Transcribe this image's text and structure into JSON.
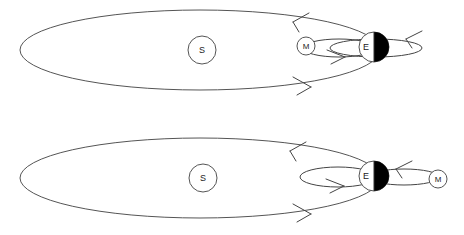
{
  "figure": {
    "background_color": "#ffffff",
    "width": 464,
    "height": 235,
    "stroke_color": "#555555",
    "shadow_color": "#000000"
  },
  "panels": [
    {
      "id": "top-panel",
      "name": "solar-eclipse-configuration",
      "bodies": {
        "sun": {
          "label": "S",
          "cx": 202,
          "cy": 50,
          "r": 14
        },
        "earth": {
          "label": "E",
          "cx": 374,
          "cy": 47,
          "r": 15,
          "shadow_side": "right"
        },
        "moon": {
          "label": "M",
          "cx": 306,
          "cy": 46,
          "r": 9,
          "side": "sunward"
        }
      },
      "orbits": {
        "earth_orbit": {
          "cx": 200,
          "cy": 50,
          "rx": 180,
          "ry": 40
        },
        "moon_orbit": {
          "cx": 340,
          "cy": 48,
          "rx": 36,
          "ry": 9,
          "extends": "right-of-earth"
        }
      },
      "arrows": [
        {
          "name": "earth-orbit-arrow-top",
          "direction": "left",
          "x": 297,
          "y": 19
        },
        {
          "name": "earth-orbit-arrow-bottom",
          "direction": "right",
          "x": 304,
          "y": 86
        },
        {
          "name": "moon-orbit-arrow-bottom",
          "direction": "right",
          "x": 341,
          "y": 56
        },
        {
          "name": "moon-orbit-arrow-top",
          "direction": "left",
          "x": 412,
          "y": 36
        }
      ]
    },
    {
      "id": "bottom-panel",
      "name": "lunar-eclipse-configuration",
      "bodies": {
        "sun": {
          "label": "S",
          "cx": 203,
          "cy": 178,
          "r": 14
        },
        "earth": {
          "label": "E",
          "cx": 374,
          "cy": 176,
          "r": 15,
          "shadow_side": "right"
        },
        "moon": {
          "label": "M",
          "cx": 438,
          "cy": 179,
          "r": 9,
          "side": "anti-sunward"
        }
      },
      "orbits": {
        "earth_orbit": {
          "cx": 200,
          "cy": 178,
          "rx": 180,
          "ry": 40
        },
        "moon_orbit": {
          "cx": 340,
          "cy": 177,
          "rx": 36,
          "ry": 9,
          "extends": "left-of-earth"
        },
        "moon_link": {
          "cx": 407,
          "cy": 178,
          "rx": 32,
          "ry": 7
        }
      },
      "arrows": [
        {
          "name": "earth-orbit-arrow-top",
          "direction": "left",
          "x": 294,
          "y": 149
        },
        {
          "name": "earth-orbit-arrow-bottom",
          "direction": "right",
          "x": 304,
          "y": 213
        },
        {
          "name": "moon-orbit-arrow-bottom",
          "direction": "right",
          "x": 340,
          "y": 185
        },
        {
          "name": "moon-link-arrow-top",
          "direction": "left",
          "x": 399,
          "y": 167
        }
      ]
    }
  ],
  "legend": {
    "sun_symbol": "S",
    "earth_symbol": "E",
    "moon_symbol": "M"
  }
}
